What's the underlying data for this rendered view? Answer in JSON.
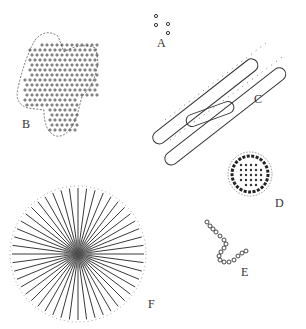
{
  "figure": {
    "labels": {
      "A": "A",
      "B": "B",
      "C": "C",
      "D": "D",
      "E": "E",
      "F": "F"
    },
    "panels": [
      {
        "id": "A",
        "description": "four small separate cocci"
      },
      {
        "id": "B",
        "description": "irregular colony of many cocci"
      },
      {
        "id": "C",
        "description": "long rod-shaped cells, overlapping"
      },
      {
        "id": "D",
        "description": "spherical cluster of cocci"
      },
      {
        "id": "E",
        "description": "curved chain of cocci"
      },
      {
        "id": "F",
        "description": "radiating filaments, rosette form"
      }
    ],
    "colors": {
      "ink": "#333333",
      "background": "#ffffff"
    }
  }
}
